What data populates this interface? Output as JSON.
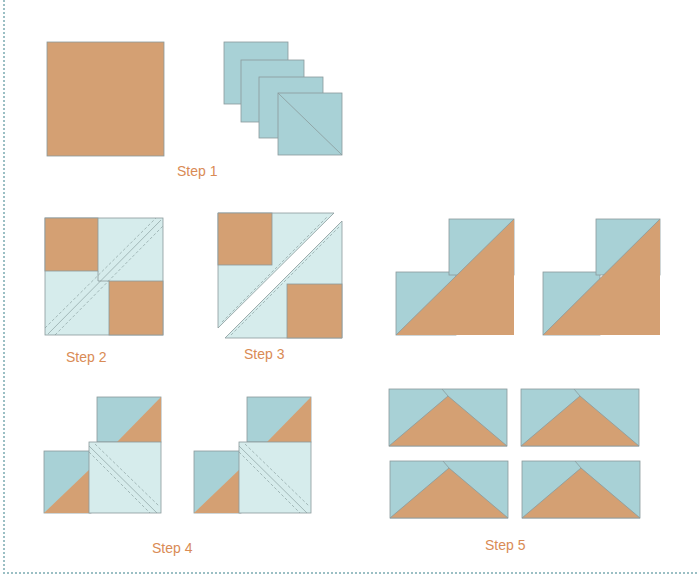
{
  "colors": {
    "tan": "#d4a073",
    "blue": "#a8d1d6",
    "light_blue": "#d6ecec",
    "edge": "#8a9a9c",
    "label": "#d98b55",
    "frame": "#9bbfc4"
  },
  "steps": [
    {
      "id": 1,
      "label": "Step 1"
    },
    {
      "id": 2,
      "label": "Step 2"
    },
    {
      "id": 3,
      "label": "Step 3"
    },
    {
      "id": 4,
      "label": "Step 4"
    },
    {
      "id": 5,
      "label": "Step 5"
    }
  ]
}
